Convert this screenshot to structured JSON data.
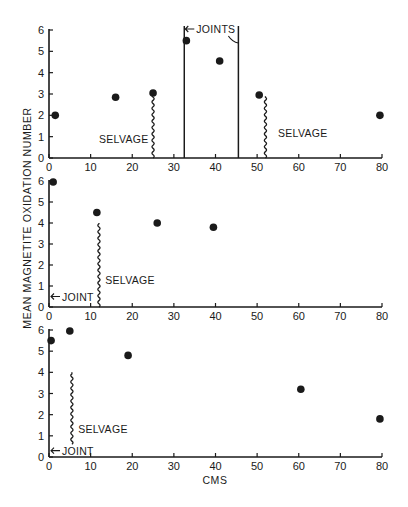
{
  "chart_data": {
    "type": "scatter",
    "ylabel": "MEAN MAGNETITE OXIDATION NUMBER",
    "xlabel": "CMS",
    "panels": [
      {
        "name": "top",
        "xlim": [
          0,
          80
        ],
        "ylim": [
          0,
          6
        ],
        "x_ticks": [
          0,
          10,
          20,
          30,
          40,
          50,
          60,
          70,
          80
        ],
        "y_ticks": [
          0,
          1,
          2,
          3,
          4,
          5,
          6
        ],
        "points": [
          {
            "x": 1.5,
            "y": 2.0
          },
          {
            "x": 16,
            "y": 2.85
          },
          {
            "x": 25,
            "y": 3.05
          },
          {
            "x": 33,
            "y": 5.5
          },
          {
            "x": 41,
            "y": 4.55
          },
          {
            "x": 50.5,
            "y": 2.95
          },
          {
            "x": 79.5,
            "y": 2.0
          }
        ],
        "selvages": [
          {
            "x": 25,
            "y_top": 3.0,
            "label": "SELVAGE",
            "label_x": 12,
            "label_y": 0.9
          },
          {
            "x": 52,
            "y_top": 2.9,
            "label": "SELVAGE",
            "label_x": 55,
            "label_y": 1.15
          }
        ],
        "joints": [
          32.5,
          45.5
        ],
        "joints_label": "JOINTS"
      },
      {
        "name": "middle",
        "xlim": [
          0,
          80
        ],
        "ylim": [
          0,
          6
        ],
        "x_ticks": [
          0,
          10,
          20,
          30,
          40,
          50,
          60,
          70,
          80
        ],
        "y_ticks": [
          0,
          1,
          2,
          3,
          4,
          5,
          6
        ],
        "points": [
          {
            "x": 1,
            "y": 5.95
          },
          {
            "x": 11.5,
            "y": 4.5
          },
          {
            "x": 26,
            "y": 4.0
          },
          {
            "x": 39.5,
            "y": 3.8
          }
        ],
        "selvages": [
          {
            "x": 12,
            "y_top": 4.0,
            "label": "SELVAGE",
            "label_x": 13.5,
            "label_y": 1.3
          }
        ],
        "joint": {
          "x": 0,
          "y": 0.5,
          "label": "JOINT"
        }
      },
      {
        "name": "bottom",
        "xlim": [
          0,
          80
        ],
        "ylim": [
          0,
          6
        ],
        "x_ticks": [
          0,
          10,
          20,
          30,
          40,
          50,
          60,
          70,
          80
        ],
        "y_ticks": [
          0,
          1,
          2,
          3,
          4,
          5,
          6
        ],
        "points": [
          {
            "x": 0.5,
            "y": 5.5
          },
          {
            "x": 5,
            "y": 5.95
          },
          {
            "x": 19,
            "y": 4.8
          },
          {
            "x": 60.5,
            "y": 3.2
          },
          {
            "x": 79.5,
            "y": 1.8
          }
        ],
        "selvages": [
          {
            "x": 5.5,
            "y_top": 4.0,
            "y_bottom": 0.6,
            "label": "SELVAGE",
            "label_x": 7,
            "label_y": 1.3
          }
        ],
        "joint": {
          "x": 0,
          "y": 0.3,
          "label": "JOINT"
        }
      }
    ]
  }
}
